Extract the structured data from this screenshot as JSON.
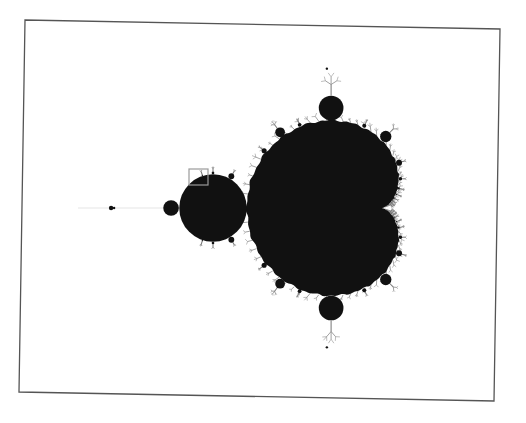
{
  "figure": {
    "background_color": "#ffffff",
    "frame_color": "#555555",
    "set_color": "#111111",
    "filament_color": "#7a7a7a",
    "highlight_box_color": "#9a9a9a",
    "view": {
      "origin_px": [
        348,
        208
      ],
      "scale_px_per_unit": 135
    },
    "frame": {
      "corners": [
        [
          25,
          20
        ],
        [
          500,
          29
        ],
        [
          494,
          401
        ],
        [
          19,
          392
        ]
      ]
    },
    "highlight_box": {
      "x": 189,
      "y": 169,
      "width": 19,
      "height": 16
    }
  }
}
